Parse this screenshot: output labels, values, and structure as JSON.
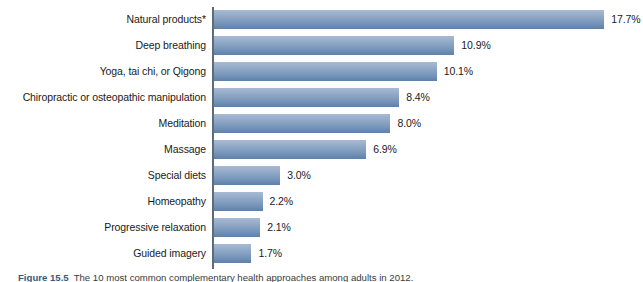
{
  "chart_data": {
    "type": "bar",
    "orientation": "horizontal",
    "title": "",
    "xlabel": "",
    "ylabel": "",
    "xlim": [
      0,
      20
    ],
    "grid": false,
    "legend": "none",
    "bar_color": "#8ca5c4",
    "axis_color": "#5d6b7a",
    "background": "#ffffff",
    "categories": [
      "Natural products*",
      "Deep breathing",
      "Yoga, tai chi, or Qigong",
      "Chiropractic or osteopathic manipulation",
      "Meditation",
      "Massage",
      "Special diets",
      "Homeopathy",
      "Progressive relaxation",
      "Guided imagery"
    ],
    "values": [
      17.7,
      10.9,
      10.1,
      8.4,
      8.0,
      6.9,
      3.0,
      2.2,
      2.1,
      1.7
    ],
    "data_labels": [
      "17.7%",
      "10.9%",
      "10.1%",
      "8.4%",
      "8.0%",
      "6.9%",
      "3.0%",
      "2.2%",
      "2.1%",
      "1.7%"
    ]
  },
  "caption": {
    "figure_number": "Figure 15.5",
    "text": "The 10 most common complementary health approaches among adults in 2012."
  }
}
